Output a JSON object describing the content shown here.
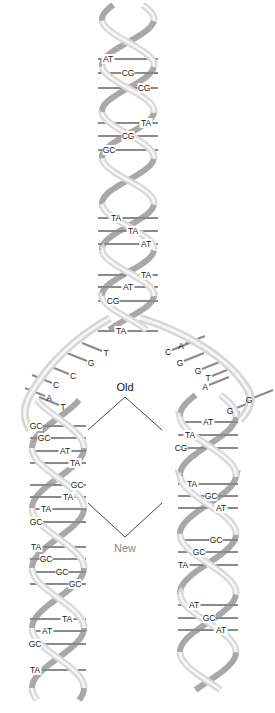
{
  "diagram": {
    "labels": {
      "old": "Old",
      "new": "New"
    },
    "colors": {
      "ribbon_light": "#e6e6e6",
      "ribbon_dark": "#a9a9a9",
      "rung": "#8a8a8a",
      "old_label": "#111111",
      "new_label": "#888888"
    },
    "parent_helix": {
      "base_pairs": [
        {
          "label": "AT",
          "y": 59,
          "x": 108
        },
        {
          "label": "CG",
          "y": 73,
          "x": 128
        },
        {
          "label": "CG",
          "y": 88,
          "x": 144
        },
        {
          "label": "TA",
          "y": 123,
          "x": 146
        },
        {
          "label": "CG",
          "y": 136,
          "x": 128
        },
        {
          "label": "GC",
          "y": 150,
          "x": 109
        },
        {
          "label": "TA",
          "y": 218,
          "x": 116
        },
        {
          "label": "TA",
          "y": 231,
          "x": 133
        },
        {
          "label": "AT",
          "y": 244,
          "x": 146
        },
        {
          "label": "TA",
          "y": 275,
          "x": 146
        },
        {
          "label": "AT",
          "y": 287,
          "x": 128
        },
        {
          "label": "CG",
          "y": 301,
          "x": 113
        },
        {
          "label": "TA",
          "y": 331,
          "x": 121
        }
      ]
    },
    "fork_unpaired": {
      "left_strand": [
        {
          "label": "T",
          "x": 106,
          "y": 353
        },
        {
          "label": "G",
          "x": 91,
          "y": 363
        },
        {
          "label": "C",
          "x": 73,
          "y": 376
        },
        {
          "label": "C",
          "x": 56,
          "y": 385
        },
        {
          "label": "A",
          "x": 49,
          "y": 398
        },
        {
          "label": "T",
          "x": 63,
          "y": 407
        }
      ],
      "right_strand": [
        {
          "label": "A",
          "x": 181,
          "y": 346
        },
        {
          "label": "C",
          "x": 168,
          "y": 352
        },
        {
          "label": "G",
          "x": 180,
          "y": 363
        },
        {
          "label": "G",
          "x": 198,
          "y": 371
        },
        {
          "label": "T",
          "x": 208,
          "y": 378
        },
        {
          "label": "A",
          "x": 205,
          "y": 387
        },
        {
          "label": "G",
          "x": 249,
          "y": 400
        },
        {
          "label": "G",
          "x": 230,
          "y": 411
        }
      ]
    },
    "left_daughter": {
      "base_pairs": [
        {
          "label": "GC",
          "y": 426,
          "x": 36
        },
        {
          "label": "GC",
          "y": 438,
          "x": 44
        },
        {
          "label": "AT",
          "y": 451,
          "x": 65
        },
        {
          "label": "TA",
          "y": 463,
          "x": 75
        },
        {
          "label": "GC",
          "y": 485,
          "x": 77
        },
        {
          "label": "TA",
          "y": 497,
          "x": 68
        },
        {
          "label": "TA",
          "y": 509,
          "x": 46
        },
        {
          "label": "GC",
          "y": 522,
          "x": 36
        },
        {
          "label": "TA",
          "y": 547,
          "x": 36
        },
        {
          "label": "GC",
          "y": 559,
          "x": 46
        },
        {
          "label": "GC",
          "y": 572,
          "x": 62
        },
        {
          "label": "GC",
          "y": 584,
          "x": 75
        },
        {
          "label": "TA",
          "y": 619,
          "x": 67
        },
        {
          "label": "AT",
          "y": 631,
          "x": 47
        },
        {
          "label": "GC",
          "y": 644,
          "x": 35
        },
        {
          "label": "TA",
          "y": 670,
          "x": 35
        }
      ]
    },
    "right_daughter": {
      "base_pairs": [
        {
          "label": "AT",
          "y": 422,
          "x": 208
        },
        {
          "label": "TA",
          "y": 435,
          "x": 190
        },
        {
          "label": "CG",
          "y": 448,
          "x": 181
        },
        {
          "label": "TA",
          "y": 484,
          "x": 192
        },
        {
          "label": "GC",
          "y": 496,
          "x": 211
        },
        {
          "label": "AT",
          "y": 508,
          "x": 221
        },
        {
          "label": "GC",
          "y": 540,
          "x": 216
        },
        {
          "label": "GC",
          "y": 552,
          "x": 199
        },
        {
          "label": "TA",
          "y": 565,
          "x": 183
        },
        {
          "label": "AT",
          "y": 605,
          "x": 194
        },
        {
          "label": "GC",
          "y": 618,
          "x": 209
        },
        {
          "label": "AT",
          "y": 630,
          "x": 221
        }
      ]
    }
  }
}
